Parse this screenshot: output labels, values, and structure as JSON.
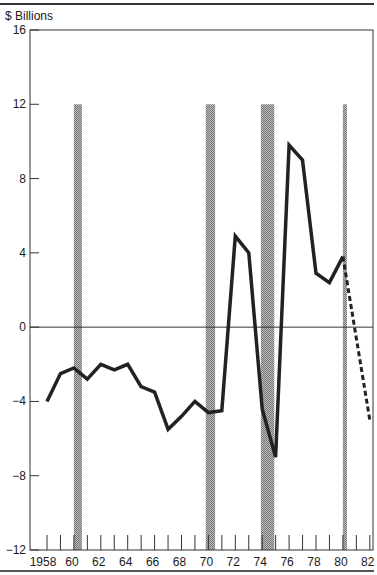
{
  "chart_data": {
    "type": "line",
    "title": "",
    "ylabel": "$ Billions",
    "xlabel": "",
    "ylim": [
      -12,
      16
    ],
    "xlim": [
      1958,
      1982
    ],
    "yticks": [
      16,
      12,
      8,
      4,
      0,
      -4,
      -8,
      -12
    ],
    "ytick_labels": [
      "16",
      "12",
      "8",
      "4",
      "0",
      "−4",
      "−8",
      "−12"
    ],
    "xtick_labels": [
      "1958",
      "60",
      "62",
      "64",
      "66",
      "68",
      "70",
      "72",
      "74",
      "76",
      "78",
      "80",
      "82"
    ],
    "xtick_years": [
      1958,
      1960,
      1962,
      1964,
      1966,
      1968,
      1970,
      1972,
      1974,
      1976,
      1978,
      1980,
      1982
    ],
    "grid": false,
    "zero_line": true,
    "series": [
      {
        "name": "Actual",
        "style": "solid",
        "color": "#222222",
        "x": [
          1958,
          1959,
          1960,
          1961,
          1962,
          1963,
          1964,
          1965,
          1966,
          1967,
          1968,
          1969,
          1970,
          1971,
          1972,
          1973,
          1974,
          1975,
          1976,
          1977,
          1978,
          1979,
          1980
        ],
        "values": [
          -4.0,
          -2.5,
          -2.2,
          -2.8,
          -2.0,
          -2.3,
          -2.0,
          -3.2,
          -3.5,
          -5.5,
          -4.8,
          -4.0,
          -4.6,
          -4.5,
          4.9,
          4.0,
          -4.4,
          -7.0,
          9.8,
          9.0,
          2.9,
          2.4,
          3.8
        ]
      },
      {
        "name": "Projected",
        "style": "dashed",
        "color": "#222222",
        "x": [
          1980,
          1982
        ],
        "values": [
          3.8,
          -5.0
        ]
      }
    ],
    "shaded_periods": [
      {
        "start": 1960.0,
        "end": 1960.6
      },
      {
        "start": 1969.8,
        "end": 1970.5
      },
      {
        "start": 1973.9,
        "end": 1974.9
      },
      {
        "start": 1980.0,
        "end": 1980.3
      }
    ],
    "shade_color": "#9a9a9a"
  }
}
